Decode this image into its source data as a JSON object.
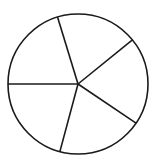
{
  "chart_data": {
    "type": "pie",
    "title": "",
    "labels": [
      "",
      "",
      "",
      "",
      ""
    ],
    "values": [
      68,
      73,
      71,
      75,
      73
    ],
    "colors": {
      "fill": "#ffffff",
      "stroke": "#1a1a1a"
    },
    "legend": "none",
    "geometry": {
      "cx": 78,
      "cy": 84,
      "r": 70,
      "spoke_angles_deg": [
        -107,
        -39,
        34,
        105,
        180
      ]
    }
  }
}
